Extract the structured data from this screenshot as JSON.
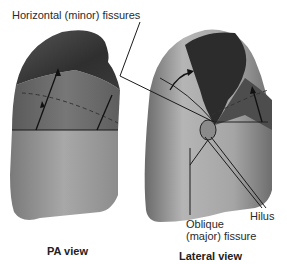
{
  "diagram": {
    "labels": {
      "horizontal_fissures": "Horizontal  (minor)  fissures",
      "hilus": "Hilus",
      "oblique_line1": "Oblique",
      "oblique_line2": "(major)  fissure"
    },
    "views": [
      {
        "title": "PA  view"
      },
      {
        "title": "Lateral  view"
      }
    ],
    "colors": {
      "upper_lobe_dark": "#2e2e2e",
      "middle_lobe": "#6e6e6e",
      "lower_lobe": "#9a9a9a",
      "line": "#1a1a1a"
    }
  }
}
